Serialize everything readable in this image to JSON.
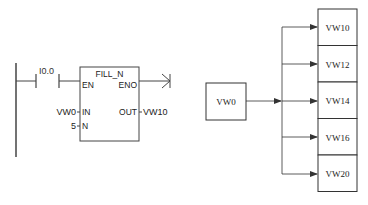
{
  "ladder": {
    "contact_label": "I0.0",
    "block_title": "FILL_N",
    "pins": {
      "en": "EN",
      "eno": "ENO",
      "in": "IN",
      "n": "N",
      "out": "OUT"
    },
    "in_operand": "VW0",
    "n_operand": "5",
    "out_operand": "VW10"
  },
  "diagram": {
    "source": "VW0",
    "targets": [
      "VW10",
      "VW12",
      "VW14",
      "VW16",
      "VW20"
    ]
  },
  "colors": {
    "line": "#333333",
    "text": "#222222",
    "background": "#ffffff"
  }
}
